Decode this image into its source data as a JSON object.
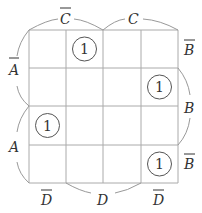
{
  "kmap": {
    "grid": {
      "x0": 29,
      "y0": 30,
      "cols": [
        29,
        66,
        103,
        141,
        178
      ],
      "rows": [
        30,
        68,
        106,
        145,
        183
      ]
    },
    "line_color": "#aaaaaa",
    "arc_color": "#999999",
    "text_color": "#333333",
    "cells": [
      [
        0,
        1,
        0,
        0
      ],
      [
        0,
        0,
        0,
        1
      ],
      [
        1,
        0,
        0,
        0
      ],
      [
        0,
        0,
        0,
        1
      ]
    ],
    "ones_label": "1",
    "top_labels": [
      {
        "var": "C",
        "negated": true,
        "text": "C"
      },
      {
        "var": "C",
        "negated": false,
        "text": "C"
      }
    ],
    "left_labels": [
      {
        "var": "A",
        "negated": true,
        "text": "A"
      },
      {
        "var": "A",
        "negated": false,
        "text": "A"
      }
    ],
    "right_labels": [
      {
        "var": "B",
        "negated": true,
        "text": "B"
      },
      {
        "var": "B",
        "negated": false,
        "text": "B"
      },
      {
        "var": "B",
        "negated": true,
        "text": "B"
      }
    ],
    "bottom_labels": [
      {
        "var": "D",
        "negated": true,
        "text": "D"
      },
      {
        "var": "D",
        "negated": false,
        "text": "D"
      },
      {
        "var": "D",
        "negated": true,
        "text": "D"
      }
    ]
  }
}
